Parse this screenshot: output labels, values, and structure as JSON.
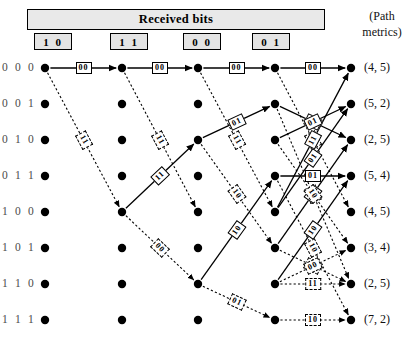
{
  "header": {
    "band_label": "Received bits",
    "metrics_header_line1": "(Path",
    "metrics_header_line2": "metrics)"
  },
  "received_bits": [
    {
      "label": "1 0",
      "x": 52,
      "y": 33
    },
    {
      "label": "1 1",
      "x": 128,
      "y": 33
    },
    {
      "label": "0 0",
      "x": 201,
      "y": 33
    },
    {
      "label": "0 1",
      "x": 270,
      "y": 33
    }
  ],
  "states": [
    {
      "label": "0 0 0",
      "metric": "(4, 5)"
    },
    {
      "label": "0 0 1",
      "metric": "(5, 2)"
    },
    {
      "label": "0 1 0",
      "metric": "(2, 5)"
    },
    {
      "label": "0 1 1",
      "metric": "(5, 4)"
    },
    {
      "label": "1 0 0",
      "metric": "(4, 5)"
    },
    {
      "label": "1 0 1",
      "metric": "(3, 4)"
    },
    {
      "label": "1 1 0",
      "metric": "(2, 5)"
    },
    {
      "label": "1 1 1",
      "metric": "(7, 2)"
    }
  ],
  "geometry": {
    "col_x": [
      45,
      122,
      198,
      275,
      351
    ],
    "row_y": [
      68,
      104,
      140,
      176,
      212,
      248,
      284,
      320
    ],
    "node_radius": 4.2
  },
  "colors": {
    "ink": "#000000",
    "band_fill": "#e9e9e9",
    "box_fill": "#e4e4e4",
    "state_text": "#4a4a4a"
  },
  "edges": [
    {
      "c": 0,
      "from": 0,
      "to": 0,
      "style": "solid",
      "label": "00"
    },
    {
      "c": 0,
      "from": 0,
      "to": 4,
      "style": "dashed",
      "label": "11"
    },
    {
      "c": 1,
      "from": 0,
      "to": 0,
      "style": "solid",
      "label": "00"
    },
    {
      "c": 1,
      "from": 0,
      "to": 4,
      "style": "dashed",
      "label": "11"
    },
    {
      "c": 1,
      "from": 4,
      "to": 2,
      "style": "solid",
      "label": "11"
    },
    {
      "c": 1,
      "from": 4,
      "to": 6,
      "style": "dashed",
      "label": "00"
    },
    {
      "c": 2,
      "from": 0,
      "to": 0,
      "style": "solid",
      "label": "00"
    },
    {
      "c": 2,
      "from": 0,
      "to": 4,
      "style": "dashed",
      "label": "11"
    },
    {
      "c": 2,
      "from": 2,
      "to": 1,
      "style": "solid",
      "label": "01"
    },
    {
      "c": 2,
      "from": 2,
      "to": 5,
      "style": "dashed",
      "label": "10"
    },
    {
      "c": 2,
      "from": 6,
      "to": 3,
      "style": "solid",
      "label": "10"
    },
    {
      "c": 2,
      "from": 6,
      "to": 7,
      "style": "dashed",
      "label": "01"
    },
    {
      "c": 3,
      "from": 0,
      "to": 0,
      "style": "solid",
      "label": "00"
    },
    {
      "c": 3,
      "from": 0,
      "to": 4,
      "style": "dashed",
      "label": "11"
    },
    {
      "c": 3,
      "from": 1,
      "to": 2,
      "style": "solid",
      "label": "00"
    },
    {
      "c": 3,
      "from": 1,
      "to": 6,
      "style": "dashed",
      "label": "11"
    },
    {
      "c": 3,
      "from": 3,
      "to": 3,
      "style": "solid",
      "label": "01"
    },
    {
      "c": 3,
      "from": 3,
      "to": 7,
      "style": "dashed",
      "label": "10"
    },
    {
      "c": 3,
      "from": 5,
      "to": 2,
      "style": "solid",
      "label": "10"
    },
    {
      "c": 3,
      "from": 5,
      "to": 6,
      "style": "dashed",
      "label": "01"
    },
    {
      "c": 3,
      "from": 7,
      "to": 7,
      "style": "dashed",
      "label": "10"
    },
    {
      "c": 3,
      "from": 4,
      "to": 0,
      "style": "solid",
      "label": "11"
    },
    {
      "c": 3,
      "from": 4,
      "to": 1,
      "style": "solid",
      "label": "01"
    },
    {
      "c": 3,
      "from": 2,
      "to": 1,
      "style": "solid",
      "label": "01"
    },
    {
      "c": 3,
      "from": 2,
      "to": 5,
      "style": "dashed",
      "label": "10"
    },
    {
      "c": 3,
      "from": 6,
      "to": 3,
      "style": "solid",
      "label": "10"
    },
    {
      "c": 3,
      "from": 6,
      "to": 5,
      "style": "dashed",
      "label": "00"
    },
    {
      "c": 3,
      "from": 6,
      "to": 6,
      "style": "dashed",
      "label": "11"
    }
  ],
  "caption": ""
}
